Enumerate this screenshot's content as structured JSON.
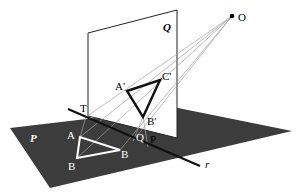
{
  "diagram": {
    "type": "perspective-projection",
    "colors": {
      "plane_P": "#3c3c3c",
      "plane_Q": "#ffffff",
      "outline": "#111111",
      "projection_lines": "#9a9a9a",
      "triangle_on_P": "#ffffff",
      "triangle_on_Q": "#111111"
    },
    "labels": {
      "plane_P": "P",
      "plane_Q": "Q",
      "center": "O",
      "T": "T",
      "A": "A",
      "B_left": "B",
      "B_right": "B",
      "Q_point": "Q",
      "P_point": "P",
      "A_prime": "A'",
      "B_prime": "B'",
      "C_prime": "C'",
      "line_r": "r"
    }
  }
}
